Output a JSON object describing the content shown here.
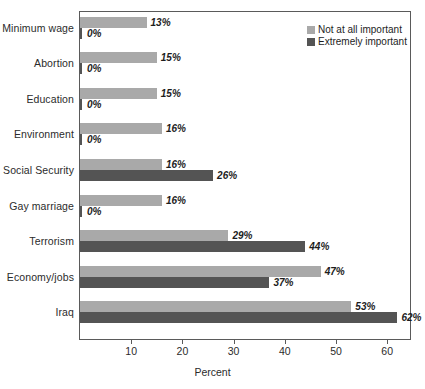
{
  "chart_data": {
    "type": "bar",
    "orientation": "horizontal",
    "title": "",
    "xlabel": "Percent",
    "ylabel": "",
    "xlim": [
      0,
      65
    ],
    "xticks": [
      10,
      20,
      30,
      40,
      50,
      60
    ],
    "xtick_labels": [
      "10",
      "20",
      "30",
      "40",
      "50",
      "60"
    ],
    "grid": false,
    "legend_position": "top-right",
    "categories": [
      "Minimum wage",
      "Abortion",
      "Education",
      "Environment",
      "Social Security",
      "Gay marriage",
      "Terrorism",
      "Economy/jobs",
      "Iraq"
    ],
    "series": [
      {
        "name": "Not at all important",
        "color": "#a9a9a9",
        "values": [
          13,
          15,
          15,
          16,
          16,
          16,
          29,
          47,
          53
        ],
        "labels": [
          "13%",
          "15%",
          "15%",
          "16%",
          "16%",
          "16%",
          "29%",
          "47%",
          "53%"
        ]
      },
      {
        "name": "Extremely important",
        "color": "#545454",
        "values": [
          0,
          0,
          0,
          0,
          26,
          0,
          44,
          37,
          62
        ],
        "labels": [
          "0%",
          "0%",
          "0%",
          "0%",
          "26%",
          "0%",
          "44%",
          "37%",
          "62%"
        ]
      }
    ]
  },
  "legend": {
    "items": [
      {
        "label": "Not at all important",
        "swatch": "light"
      },
      {
        "label": "Extremely important",
        "swatch": "dark"
      }
    ]
  },
  "axis": {
    "x_title": "Percent"
  }
}
